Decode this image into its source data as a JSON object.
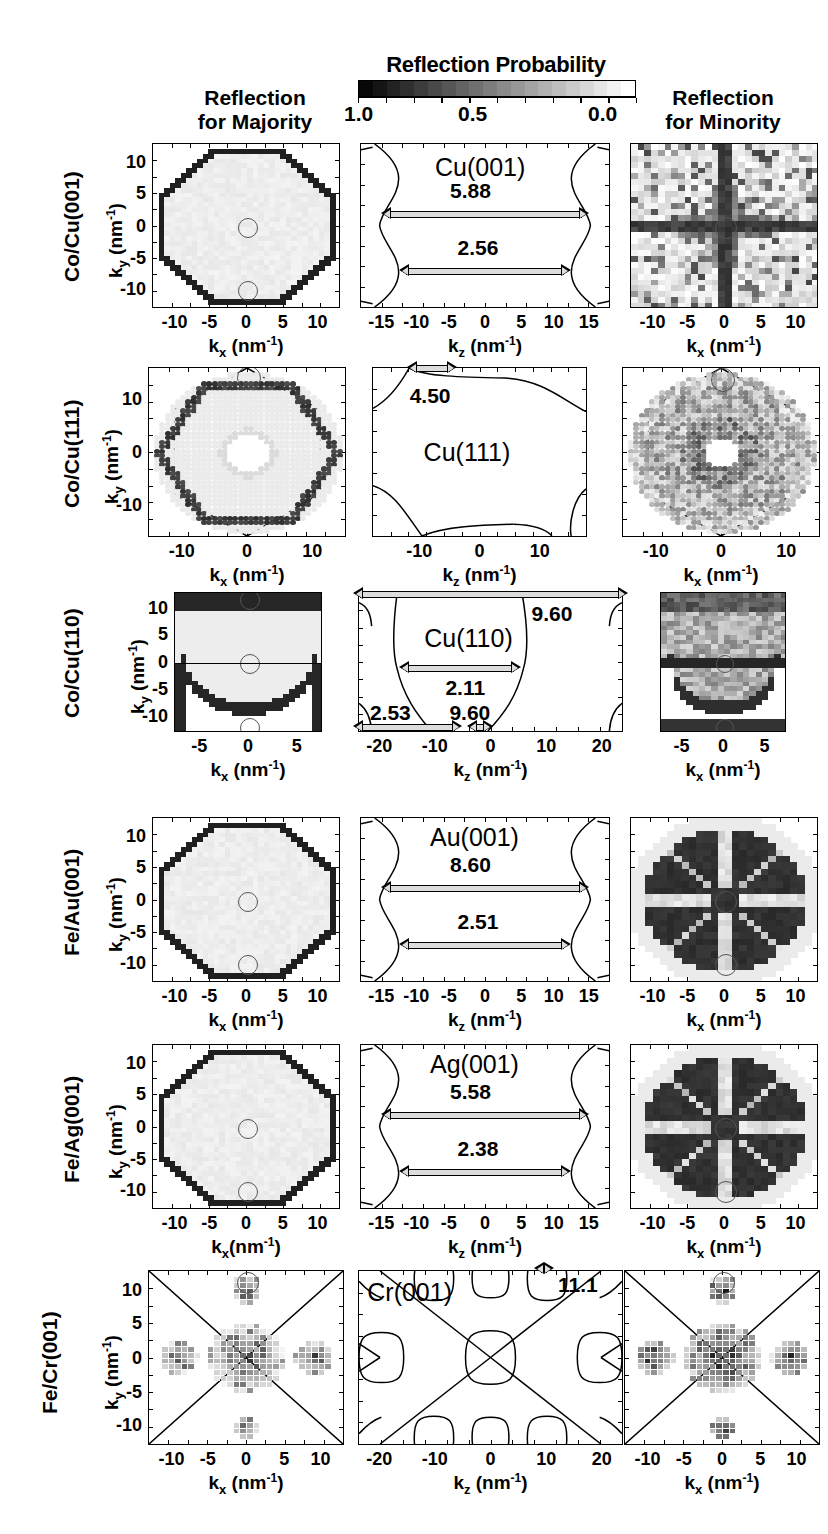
{
  "figure": {
    "colorbar": {
      "title": "Reflection Probability",
      "tick_high": "1.0",
      "tick_mid": "0.5",
      "tick_low": "0.0",
      "high_color": "#0a0a0a",
      "low_color": "#ffffff",
      "steps": 20
    },
    "column_headers": {
      "majority": "Reflection\nfor  Majority",
      "majority_line1": "Reflection",
      "majority_line2": "for  Majority",
      "minority_line1": "Reflection",
      "minority_line2": "for  Minority"
    },
    "axis_labels": {
      "kx": "k",
      "kx_sub": "x",
      "kz_sub": "z",
      "ky_sub": "y",
      "unit": " (nm",
      "unit_sup": "-1",
      "unit_close": ")",
      "kx_full": "k_x (nm^-1)",
      "kz_full": "k_z (nm^-1)",
      "ky_full": "k_y (nm^-1)"
    },
    "rows": [
      {
        "id": "co-cu-001",
        "label": "Co/Cu(001)",
        "fermi_surface": "Cu(001)",
        "arrows": [
          {
            "value": "5.88",
            "position": "upper-neck"
          },
          {
            "value": "2.56",
            "position": "lower-neck"
          }
        ],
        "majority": {
          "x_ticks": [
            "-10",
            "-5",
            "0",
            "5",
            "10"
          ],
          "y_ticks": [
            "10",
            "5",
            "0",
            "-5",
            "-10"
          ],
          "x_label": "k_x (nm^-1)",
          "y_label": "k_y (nm^-1)"
        },
        "middle": {
          "x_ticks": [
            "-15",
            "-10",
            "-5",
            "0",
            "5",
            "10",
            "15"
          ],
          "x_label": "k_z (nm^-1)"
        },
        "minority": {
          "x_ticks": [
            "-10",
            "-5",
            "0",
            "5",
            "10"
          ],
          "x_label": "k_x (nm^-1)"
        }
      },
      {
        "id": "co-cu-111",
        "label": "Co/Cu(111)",
        "fermi_surface": "Cu(111)",
        "arrows": [
          {
            "value": "4.50",
            "position": "top-neck"
          }
        ],
        "majority": {
          "x_ticks": [
            "-10",
            "0",
            "10"
          ],
          "y_ticks": [
            "10",
            "0",
            "-10"
          ],
          "x_label": "k_x (nm^-1)",
          "y_label": "k_y (nm^-1)"
        },
        "middle": {
          "x_ticks": [
            "-10",
            "0",
            "10"
          ],
          "x_label": "k_z (nm^-1)"
        },
        "minority": {
          "x_ticks": [
            "-10",
            "0",
            "10"
          ],
          "x_label": "k_x (nm^-1)"
        }
      },
      {
        "id": "co-cu-110",
        "label": "Co/Cu(110)",
        "fermi_surface": "Cu(110)",
        "arrows": [
          {
            "value": "9.60",
            "position": "top"
          },
          {
            "value": "2.11",
            "position": "middle"
          },
          {
            "value": "2.53",
            "position": "bottom-left"
          },
          {
            "value": "9.60",
            "position": "bottom-center"
          }
        ],
        "majority": {
          "x_ticks": [
            "-5",
            "0",
            "5"
          ],
          "y_ticks": [
            "10",
            "5",
            "0",
            "-5",
            "-10"
          ],
          "x_label": "k_x (nm^-1)",
          "y_label": "k_y (nm^-1)"
        },
        "middle": {
          "x_ticks": [
            "-20",
            "-10",
            "0",
            "10",
            "20"
          ],
          "x_label": "k_z (nm^-1)"
        },
        "minority": {
          "x_ticks": [
            "-5",
            "0",
            "5"
          ],
          "x_label": "k_x (nm^-1)"
        }
      },
      {
        "id": "fe-au-001",
        "label": "Fe/Au(001)",
        "fermi_surface": "Au(001)",
        "arrows": [
          {
            "value": "8.60",
            "position": "upper-neck"
          },
          {
            "value": "2.51",
            "position": "lower-neck"
          }
        ],
        "majority": {
          "x_ticks": [
            "-10",
            "-5",
            "0",
            "5",
            "10"
          ],
          "y_ticks": [
            "10",
            "5",
            "0",
            "-5",
            "-10"
          ],
          "x_label": "k_x (nm^-1)",
          "y_label": "k_y (nm^-1)"
        },
        "middle": {
          "x_ticks": [
            "-15",
            "-10",
            "-5",
            "0",
            "5",
            "10",
            "15"
          ],
          "x_label": "k_z (nm^-1)"
        },
        "minority": {
          "x_ticks": [
            "-10",
            "-5",
            "0",
            "5",
            "10"
          ],
          "x_label": "k_x (nm^-1)"
        }
      },
      {
        "id": "fe-ag-001",
        "label": "Fe/Ag(001)",
        "fermi_surface": "Ag(001)",
        "arrows": [
          {
            "value": "5.58",
            "position": "upper-neck"
          },
          {
            "value": "2.38",
            "position": "lower-neck"
          }
        ],
        "majority": {
          "x_ticks": [
            "-10",
            "-5",
            "0",
            "5",
            "10"
          ],
          "y_ticks": [
            "10",
            "5",
            "0",
            "-5",
            "-10"
          ],
          "x_label": "k_x(nm^-1)",
          "y_label": "k_y (nm^-1)"
        },
        "middle": {
          "x_ticks": [
            "-15",
            "-10",
            "-5",
            "0",
            "5",
            "10",
            "15"
          ],
          "x_label": "k_z (nm^-1)"
        },
        "minority": {
          "x_ticks": [
            "-10",
            "-5",
            "0",
            "5",
            "10"
          ],
          "x_label": "k_x (nm^-1)"
        }
      },
      {
        "id": "fe-cr-001",
        "label": "Fe/Cr(001)",
        "fermi_surface": "Cr(001)",
        "arrows": [
          {
            "value": "11.1",
            "position": "top-right"
          }
        ],
        "majority": {
          "x_ticks": [
            "-10",
            "-5",
            "0",
            "5",
            "10"
          ],
          "y_ticks": [
            "10",
            "5",
            "0",
            "-5",
            "-10"
          ],
          "x_label": "k_x (nm^-1)",
          "y_label": "k_y (nm^-1)"
        },
        "middle": {
          "x_ticks": [
            "-20",
            "-10",
            "0",
            "10",
            "20"
          ],
          "x_label": "k_z (nm^-1)"
        },
        "minority": {
          "x_ticks": [
            "-10",
            "-5",
            "0",
            "5",
            "10"
          ],
          "x_label": "k_x (nm^-1)"
        }
      }
    ]
  },
  "chart_data": {
    "type": "heatmap",
    "title": "Reflection Probability",
    "colorbar": {
      "min": 0.0,
      "max": 1.0,
      "reversed": true,
      "ticks": [
        1.0,
        0.5,
        0.0
      ]
    },
    "columns": [
      "Reflection for Majority",
      "Fermi surface cross-section",
      "Reflection for Minority"
    ],
    "rows": [
      "Co/Cu(001)",
      "Co/Cu(111)",
      "Co/Cu(110)",
      "Fe/Au(001)",
      "Fe/Ag(001)",
      "Fe/Cr(001)"
    ],
    "fermi_surfaces": [
      "Cu(001)",
      "Cu(111)",
      "Cu(110)",
      "Au(001)",
      "Ag(001)",
      "Cr(001)"
    ],
    "caliper_values": {
      "Cu(001)": [
        5.88,
        2.56
      ],
      "Cu(111)": [
        4.5
      ],
      "Cu(110)": [
        9.6,
        2.11,
        2.53,
        9.6
      ],
      "Au(001)": [
        8.6,
        2.51
      ],
      "Ag(001)": [
        5.58,
        2.38
      ],
      "Cr(001)": [
        11.1
      ]
    },
    "axis_ranges": {
      "Co/Cu(001)_majority_x": [
        -13,
        13
      ],
      "Co/Cu(001)_majority_y": [
        -13,
        13
      ],
      "Co/Cu(001)_middle_x": [
        -18,
        18
      ],
      "Co/Cu(111)_majority_x": [
        -17,
        17
      ],
      "Co/Cu(111)_middle_x": [
        -16,
        16
      ],
      "Co/Cu(110)_majority_x": [
        -9,
        9
      ],
      "Co/Cu(110)_majority_y": [
        -13,
        13
      ],
      "Co/Cu(110)_middle_x": [
        -23,
        23
      ],
      "Fe/Au(001)_majority_x": [
        -11,
        11
      ],
      "Fe/Au(001)_middle_x": [
        -17,
        17
      ],
      "Fe/Ag(001)_majority_x": [
        -11,
        11
      ],
      "Fe/Ag(001)_middle_x": [
        -17,
        17
      ],
      "Fe/Cr(001)_majority_x": [
        -12,
        12
      ],
      "Fe/Cr(001)_middle_x": [
        -24,
        24
      ]
    },
    "xlabel": "k_x (nm^-1) / k_z (nm^-1)",
    "ylabel": "k_y (nm^-1)",
    "grid": false,
    "legend_position": "top-center"
  }
}
